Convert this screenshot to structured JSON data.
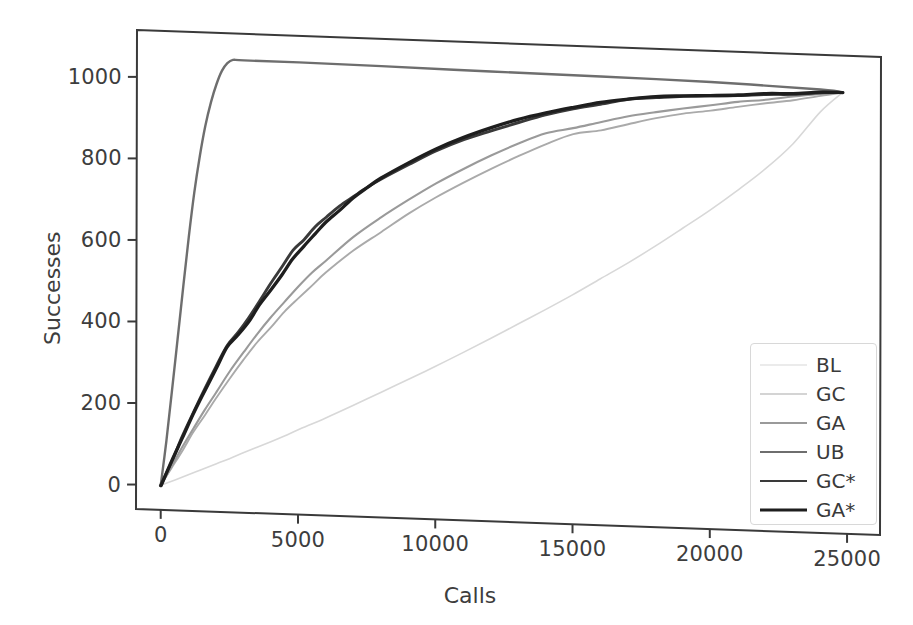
{
  "chart_data": {
    "type": "line",
    "title": "",
    "xlabel": "Calls",
    "ylabel": "Successes",
    "xlim": [
      -900,
      26200
    ],
    "ylim": [
      -60,
      1115
    ],
    "xticks": [
      0,
      5000,
      10000,
      15000,
      20000,
      25000
    ],
    "xticklabels": [
      "0",
      "5000",
      "10000",
      "15000",
      "20000",
      "25000"
    ],
    "yticks": [
      0,
      200,
      400,
      600,
      800,
      1000
    ],
    "yticklabels": [
      "0",
      "200",
      "400",
      "600",
      "800",
      "1000"
    ],
    "grid": false,
    "legend_position": "lower right",
    "series": [
      {
        "name": "BL",
        "color": "#d8d8d8",
        "width": 1.6,
        "x": [
          0,
          500,
          1000,
          1500,
          2000,
          2500,
          3000,
          3500,
          4000,
          4500,
          5000,
          6000,
          7000,
          8000,
          9000,
          10000,
          11000,
          12000,
          13000,
          14000,
          15000,
          16000,
          17000,
          18000,
          19000,
          20000,
          21000,
          22000,
          23000,
          24000,
          24800
        ],
        "y": [
          0,
          14,
          28,
          43,
          57,
          72,
          87,
          102,
          117,
          132,
          148,
          180,
          213,
          247,
          281,
          316,
          352,
          389,
          427,
          465,
          504,
          545,
          587,
          631,
          677,
          724,
          775,
          830,
          893,
          975,
          1024
        ]
      },
      {
        "name": "GC",
        "color": "#aaaaaa",
        "width": 1.9,
        "x": [
          0,
          400,
          800,
          1200,
          1600,
          2000,
          2500,
          3000,
          3500,
          4000,
          4500,
          5000,
          5500,
          6000,
          7000,
          8000,
          9000,
          10000,
          11000,
          12000,
          13000,
          14000,
          15000,
          16000,
          17000,
          18000,
          19000,
          20000,
          21000,
          22000,
          23000,
          24000,
          24800
        ],
        "y": [
          0,
          45,
          90,
          134,
          176,
          218,
          268,
          315,
          358,
          398,
          436,
          472,
          505,
          536,
          592,
          642,
          688,
          730,
          769,
          805,
          839,
          870,
          899,
          911,
          927,
          944,
          958,
          968,
          979,
          990,
          1002,
          1014,
          1024
        ]
      },
      {
        "name": "GA",
        "color": "#9a9a9a",
        "width": 2.1,
        "x": [
          0,
          400,
          800,
          1200,
          1600,
          2000,
          2500,
          3000,
          3500,
          4000,
          4500,
          5000,
          5500,
          6000,
          7000,
          8000,
          9000,
          10000,
          11000,
          12000,
          13000,
          14000,
          15000,
          16000,
          17000,
          18000,
          19000,
          20000,
          21000,
          22000,
          23000,
          24000,
          24800
        ],
        "y": [
          0,
          48,
          96,
          143,
          188,
          232,
          285,
          334,
          380,
          422,
          462,
          500,
          535,
          567,
          625,
          676,
          723,
          765,
          803,
          839,
          871,
          898,
          913,
          930,
          947,
          960,
          971,
          981,
          991,
          1000,
          1009,
          1018,
          1024
        ]
      },
      {
        "name": "UB",
        "color": "#6e6e6e",
        "width": 2.4,
        "x": [
          0,
          200,
          400,
          600,
          800,
          1000,
          1200,
          1400,
          1600,
          1800,
          2000,
          2200,
          2400,
          2600,
          3000,
          5000,
          8000,
          12000,
          16000,
          20000,
          24000,
          24800
        ],
        "y": [
          0,
          110,
          230,
          360,
          490,
          610,
          720,
          810,
          885,
          945,
          990,
          1022,
          1042,
          1050,
          1050,
          1050,
          1048,
          1045,
          1042,
          1038,
          1030,
          1024
        ]
      },
      {
        "name": "GC*",
        "color": "#3a3a3a",
        "width": 2.9,
        "x": [
          0,
          400,
          800,
          1200,
          1600,
          2000,
          2400,
          2800,
          3200,
          3600,
          4000,
          4400,
          4800,
          5200,
          5600,
          6000,
          6500,
          7000,
          7500,
          8000,
          9000,
          10000,
          11000,
          12000,
          13000,
          14000,
          15000,
          16000,
          17000,
          18000,
          19000,
          20000,
          21000,
          22000,
          23000,
          24000,
          24800
        ],
        "y": [
          0,
          62,
          124,
          184,
          242,
          298,
          350,
          382,
          418,
          462,
          505,
          548,
          588,
          614,
          648,
          672,
          700,
          726,
          750,
          772,
          810,
          845,
          875,
          900,
          922,
          942,
          960,
          975,
          988,
          996,
          1001,
          1005,
          1008,
          1012,
          1016,
          1021,
          1024
        ]
      },
      {
        "name": "GA*",
        "color": "#1e1e1e",
        "width": 3.3,
        "x": [
          0,
          400,
          800,
          1200,
          1600,
          2000,
          2400,
          2800,
          3200,
          3600,
          4000,
          4400,
          4800,
          5200,
          5600,
          6000,
          6500,
          7000,
          7500,
          8000,
          9000,
          10000,
          11000,
          12000,
          13000,
          14000,
          15000,
          16000,
          17000,
          18000,
          19000,
          20000,
          21000,
          22000,
          23000,
          24000,
          24800
        ],
        "y": [
          0,
          60,
          120,
          179,
          236,
          291,
          344,
          376,
          412,
          452,
          490,
          528,
          566,
          600,
          632,
          661,
          692,
          722,
          748,
          772,
          814,
          850,
          880,
          906,
          929,
          948,
          964,
          978,
          990,
          997,
          1002,
          1006,
          1010,
          1014,
          1018,
          1022,
          1024
        ]
      }
    ]
  },
  "axes": {
    "ylabel": "Successes",
    "xlabel": "Calls"
  },
  "legend": {
    "items": [
      {
        "label": "BL"
      },
      {
        "label": "GC"
      },
      {
        "label": "GA"
      },
      {
        "label": "UB"
      },
      {
        "label": "GC*"
      },
      {
        "label": "GA*"
      }
    ]
  }
}
